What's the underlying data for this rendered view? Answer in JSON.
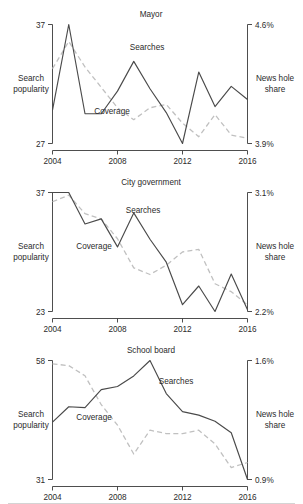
{
  "figure": {
    "shared_xlabels": [
      "2004",
      "2008",
      "2012",
      "2016"
    ],
    "left_axis_title": "Search\npopularity",
    "left_axis_title_line1": "Search",
    "left_axis_title_line2": "popularity",
    "right_axis_title_line1": "News hole",
    "right_axis_title_line2": "share",
    "series_label_solid": "Searches",
    "series_label_dashed": "Coverage",
    "colors": {
      "solid_line": "#4a4a4a",
      "dashed_line": "#c0c0c0",
      "axis": "#3a3a3a",
      "text": "#2b2b2b",
      "background": "#ffffff"
    }
  },
  "chart_data": [
    {
      "type": "line",
      "title": "Mayor",
      "xlabel": "",
      "ylabel": "Search popularity",
      "y2label": "News hole share",
      "x": [
        2004,
        2005,
        2006,
        2007,
        2008,
        2009,
        2010,
        2011,
        2012,
        2013,
        2014,
        2015,
        2016
      ],
      "xlim": [
        2004,
        2016
      ],
      "xticks": [
        2004,
        2008,
        2012,
        2016
      ],
      "ylim": [
        27,
        37
      ],
      "yticks": [
        27,
        37
      ],
      "yticklabels": [
        "27",
        "37"
      ],
      "y2lim": [
        3.9,
        4.6
      ],
      "y2ticks": [
        3.9,
        4.6
      ],
      "y2ticklabels": [
        "3.9%",
        "4.6%"
      ],
      "grid": false,
      "legend": "inline-annotations",
      "series": [
        {
          "name": "Searches",
          "style": "solid",
          "axis": "left",
          "values": [
            29.8,
            37.0,
            29.5,
            29.5,
            31.4,
            33.9,
            31.6,
            29.6,
            27.0,
            33.0,
            30.1,
            31.8,
            30.7
          ]
        },
        {
          "name": "Coverage",
          "style": "dashed",
          "axis": "right",
          "values": [
            4.34,
            4.5,
            4.35,
            4.23,
            4.11,
            4.04,
            4.11,
            4.13,
            4.02,
            3.94,
            4.07,
            3.95,
            3.93
          ]
        }
      ],
      "annotations": [
        {
          "text": "Searches",
          "x": 2009,
          "y": 34.9
        },
        {
          "text": "Coverage",
          "x": 2007.5,
          "y": 28.7
        }
      ]
    },
    {
      "type": "line",
      "title": "City government",
      "xlabel": "",
      "ylabel": "Search popularity",
      "y2label": "News hole share",
      "x": [
        2004,
        2005,
        2006,
        2007,
        2008,
        2009,
        2010,
        2011,
        2012,
        2013,
        2014,
        2015,
        2016
      ],
      "xlim": [
        2004,
        2016
      ],
      "xticks": [
        2004,
        2008,
        2012,
        2016
      ],
      "ylim": [
        23,
        37
      ],
      "yticks": [
        23,
        37
      ],
      "yticklabels": [
        "23",
        "37"
      ],
      "y2lim": [
        2.2,
        3.1
      ],
      "y2ticks": [
        2.2,
        3.1
      ],
      "y2ticklabels": [
        "2.2%",
        "3.1%"
      ],
      "grid": false,
      "legend": "inline-annotations",
      "series": [
        {
          "name": "Searches",
          "style": "solid",
          "axis": "left",
          "values": [
            37.0,
            37.0,
            33.3,
            33.9,
            30.6,
            34.6,
            31.5,
            28.8,
            23.8,
            26.0,
            23.0,
            27.4,
            23.2
          ]
        },
        {
          "name": "Coverage",
          "style": "dashed",
          "axis": "right",
          "values": [
            3.03,
            3.08,
            2.94,
            2.9,
            2.75,
            2.53,
            2.48,
            2.55,
            2.65,
            2.67,
            2.41,
            2.35,
            2.25
          ]
        }
      ],
      "annotations": [
        {
          "text": "Searches",
          "x": 2009,
          "y": 35.4
        },
        {
          "text": "Coverage",
          "x": 2006.9,
          "y": 29.0
        }
      ]
    },
    {
      "type": "line",
      "title": "School board",
      "xlabel": "",
      "ylabel": "Search popularity",
      "y2label": "News hole share",
      "x": [
        2004,
        2005,
        2006,
        2007,
        2008,
        2009,
        2010,
        2011,
        2012,
        2013,
        2014,
        2015,
        2016
      ],
      "xlim": [
        2004,
        2016
      ],
      "xticks": [
        2004,
        2008,
        2012,
        2016
      ],
      "ylim": [
        31,
        58
      ],
      "yticks": [
        31,
        58
      ],
      "yticklabels": [
        "31",
        "58"
      ],
      "y2lim": [
        0.9,
        1.6
      ],
      "y2ticks": [
        0.9,
        1.6
      ],
      "y2ticklabels": [
        "0.9%",
        "1.6%"
      ],
      "grid": false,
      "legend": "inline-annotations",
      "series": [
        {
          "name": "Searches",
          "style": "solid",
          "axis": "left",
          "values": [
            44.0,
            47.5,
            47.3,
            51.4,
            52.1,
            54.5,
            58.0,
            50.5,
            46.4,
            45.6,
            44.2,
            41.6,
            31.0
          ]
        },
        {
          "name": "Coverage",
          "style": "dashed",
          "axis": "right",
          "values": [
            1.58,
            1.57,
            1.51,
            1.34,
            1.22,
            1.05,
            1.19,
            1.17,
            1.17,
            1.19,
            1.11,
            0.97,
            1.0
          ]
        }
      ],
      "annotations": [
        {
          "text": "Searches",
          "x": 2011.1,
          "y": 52.6
        },
        {
          "text": "Coverage",
          "x": 2006.9,
          "y": 44.6
        }
      ]
    }
  ]
}
